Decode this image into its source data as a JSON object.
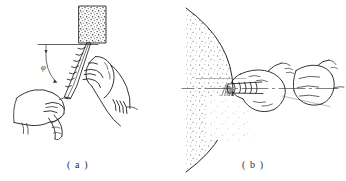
{
  "figure": {
    "background_color": "#ffffff",
    "ink_color": "#1f1f1f",
    "panels": [
      {
        "id": "panel-a",
        "caption": "( a )",
        "subject": "hands holding twist drill bit against abrasive grinding block",
        "annotation": {
          "angle_symbol": "φ",
          "reference_line": "horizontal datum line",
          "arc": "angle arc from horizontal datum to drill axis",
          "tick": "downward tick mark on datum line"
        },
        "elements": [
          "grinding-block",
          "reference-line",
          "angle-arc",
          "angle-label",
          "drill-bit",
          "right-hand",
          "left-hand"
        ]
      },
      {
        "id": "panel-b",
        "caption": "( b )",
        "subject": "side view of drill bit ground on curved grinding wheel with sparks",
        "annotation": {
          "centerline": "dash-dot horizontal centerline",
          "sparks": "spark stream from contact point"
        },
        "elements": [
          "grinding-wheel",
          "centerline",
          "sparks",
          "drill-bit",
          "front-hand",
          "rear-fist"
        ]
      }
    ]
  },
  "captions": {
    "a": "( a )",
    "b": "( b )"
  }
}
